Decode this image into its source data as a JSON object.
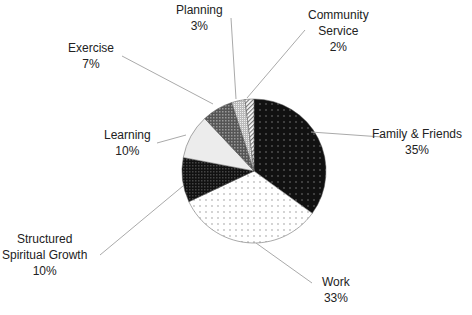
{
  "chart_data": {
    "type": "pie",
    "title": "",
    "start_angle_deg": 0,
    "direction": "clockwise",
    "slices": [
      {
        "label": "Family & Friends",
        "value": 35,
        "pct": "35%",
        "fill": "#111111",
        "pattern": "dots-light"
      },
      {
        "label": "Work",
        "value": 33,
        "pct": "33%",
        "fill": "#ffffff",
        "pattern": "dots-dark"
      },
      {
        "label": "Structured Spiritual Growth",
        "label_lines": [
          "Structured",
          "Spiritual Growth"
        ],
        "value": 10,
        "pct": "10%",
        "fill": "#1a1a1a",
        "pattern": "checker"
      },
      {
        "label": "Learning",
        "value": 10,
        "pct": "10%",
        "fill": "#ececec",
        "pattern": "none"
      },
      {
        "label": "Exercise",
        "value": 7,
        "pct": "7%",
        "fill": "#707070",
        "pattern": "checker"
      },
      {
        "label": "Planning",
        "value": 3,
        "pct": "3%",
        "fill": "#c8c8c8",
        "pattern": "checker-fine"
      },
      {
        "label": "Community Service",
        "label_lines": [
          "Community",
          "Service"
        ],
        "value": 2,
        "pct": "2%",
        "fill": "#e0e0e0",
        "pattern": "diagonal"
      }
    ],
    "legend": "none",
    "data_labels": "category-and-percent"
  },
  "labels": {
    "family": {
      "name": "Family & Friends",
      "pct": "35%"
    },
    "work": {
      "name": "Work",
      "pct": "33%"
    },
    "spiritual": {
      "line1": "Structured",
      "line2": "Spiritual Growth",
      "pct": "10%"
    },
    "learning": {
      "name": "Learning",
      "pct": "10%"
    },
    "exercise": {
      "name": "Exercise",
      "pct": "7%"
    },
    "planning": {
      "name": "Planning",
      "pct": "3%"
    },
    "community": {
      "line1": "Community",
      "line2": "Service",
      "pct": "2%"
    }
  }
}
